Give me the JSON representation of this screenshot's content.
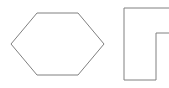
{
  "canvas": {
    "width": 169,
    "height": 88,
    "background_color": "#ffffff",
    "description": "Line drawing of two geometric outlines on a white background"
  },
  "style": {
    "stroke_color": "#808080",
    "stroke_width": 1,
    "fill": "none"
  },
  "shapes": [
    {
      "id": "hexagon",
      "name": "hexagon",
      "kind": "polygon",
      "closed": true,
      "sides": 6,
      "label": "Hexagon",
      "points": "11,44 37,13 78,13 104,44 78,75 37,75",
      "vertices": [
        {
          "x": 11,
          "y": 44
        },
        {
          "x": 37,
          "y": 13
        },
        {
          "x": 78,
          "y": 13
        },
        {
          "x": 104,
          "y": 44
        },
        {
          "x": 78,
          "y": 75
        },
        {
          "x": 37,
          "y": 75
        }
      ],
      "bbox": {
        "x": 11,
        "y": 13,
        "width": 93,
        "height": 62
      }
    },
    {
      "id": "notched-rectangle",
      "name": "notched-rectangle",
      "kind": "polyline",
      "closed": false,
      "label": "Notched rectangle (clipped at right edge)",
      "points": "172,8 124,8 124,80 156,80 156,33 172,33",
      "vertices": [
        {
          "x": 172,
          "y": 8
        },
        {
          "x": 124,
          "y": 8
        },
        {
          "x": 124,
          "y": 80
        },
        {
          "x": 156,
          "y": 80
        },
        {
          "x": 156,
          "y": 33
        },
        {
          "x": 172,
          "y": 33
        }
      ],
      "bbox": {
        "x": 124,
        "y": 8,
        "width": 48,
        "height": 72
      }
    }
  ]
}
